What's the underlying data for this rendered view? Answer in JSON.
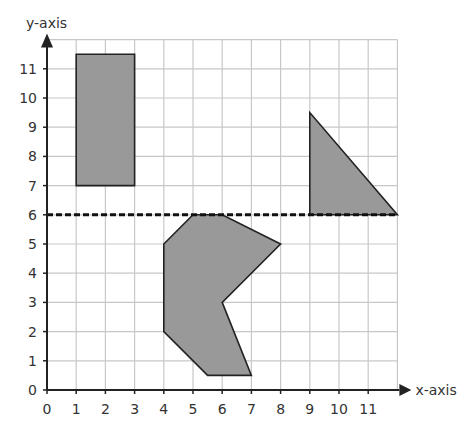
{
  "diagram": {
    "type": "coordinate-grid",
    "x_axis": {
      "label": "x-axis",
      "min": 0,
      "max": 12,
      "ticks": [
        "0",
        "1",
        "2",
        "3",
        "4",
        "5",
        "6",
        "7",
        "8",
        "9",
        "10",
        "11"
      ]
    },
    "y_axis": {
      "label": "y-axis",
      "min": 0,
      "max": 12,
      "ticks": [
        "0",
        "1",
        "2",
        "3",
        "4",
        "5",
        "6",
        "7",
        "8",
        "9",
        "10",
        "11"
      ]
    },
    "reflection_line": {
      "y": 6,
      "x_from": 0,
      "x_to": 12,
      "style": "dashed"
    },
    "shapes": [
      {
        "name": "rectangle",
        "points": [
          [
            1,
            7
          ],
          [
            3,
            7
          ],
          [
            3,
            11.5
          ],
          [
            1,
            11.5
          ]
        ]
      },
      {
        "name": "triangle",
        "points": [
          [
            9,
            6
          ],
          [
            12,
            6
          ],
          [
            9,
            9.5
          ]
        ]
      },
      {
        "name": "polygon",
        "points": [
          [
            5,
            6
          ],
          [
            6,
            6
          ],
          [
            8,
            5
          ],
          [
            6,
            3
          ],
          [
            7,
            0.5
          ],
          [
            5.5,
            0.5
          ],
          [
            4,
            2
          ],
          [
            4,
            5
          ]
        ]
      }
    ],
    "colors": {
      "shape_fill": "#999999",
      "shape_stroke": "#222222",
      "grid": "#c8c8c8",
      "axis": "#222222",
      "text": "#333333"
    }
  }
}
